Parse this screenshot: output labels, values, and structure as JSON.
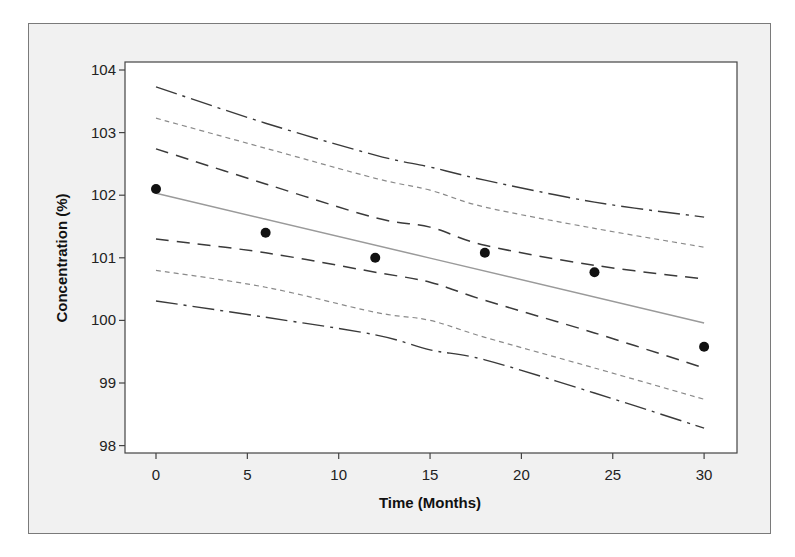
{
  "chart_data": {
    "type": "scatter",
    "title": "",
    "xlabel": "Time (Months)",
    "ylabel": "Concentration (%)",
    "xlim": [
      -1.7,
      31.8
    ],
    "ylim": [
      97.9,
      104.1
    ],
    "x_ticks": [
      0,
      5,
      10,
      15,
      20,
      25,
      30
    ],
    "y_ticks": [
      98,
      99,
      100,
      101,
      102,
      103,
      104
    ],
    "grid": false,
    "legend": null,
    "points": {
      "name": "Observed",
      "x": [
        0,
        6,
        12,
        18,
        24,
        30
      ],
      "y": [
        102.1,
        101.4,
        101.0,
        101.08,
        100.77,
        99.58
      ]
    },
    "series": [
      {
        "name": "Upper outer band",
        "style": "dash-dot",
        "x": [
          0,
          6,
          12,
          15,
          18,
          24,
          30
        ],
        "y": [
          103.73,
          103.15,
          102.64,
          102.45,
          102.24,
          101.89,
          101.65
        ]
      },
      {
        "name": "Upper middle band",
        "style": "short-dash",
        "x": [
          0,
          6,
          12,
          15,
          18,
          24,
          30
        ],
        "y": [
          103.23,
          102.75,
          102.27,
          102.08,
          101.81,
          101.47,
          101.17
        ]
      },
      {
        "name": "Upper inner band",
        "style": "dashed",
        "x": [
          0,
          6,
          12,
          15,
          18,
          24,
          30
        ],
        "y": [
          102.74,
          102.18,
          101.64,
          101.49,
          101.2,
          100.88,
          100.66
        ]
      },
      {
        "name": "Regression line",
        "style": "solid",
        "x": [
          0,
          30
        ],
        "y": [
          102.03,
          99.96
        ]
      },
      {
        "name": "Lower inner band",
        "style": "dashed",
        "x": [
          0,
          6,
          12,
          15,
          18,
          24,
          30
        ],
        "y": [
          101.3,
          101.08,
          100.77,
          100.61,
          100.32,
          99.8,
          99.24
        ]
      },
      {
        "name": "Lower middle band",
        "style": "short-dash",
        "x": [
          0,
          6,
          12,
          15,
          18,
          24,
          30
        ],
        "y": [
          100.8,
          100.53,
          100.13,
          100.0,
          99.73,
          99.24,
          98.74
        ]
      },
      {
        "name": "Lower outer band",
        "style": "dash-dot",
        "x": [
          0,
          6,
          12,
          15,
          18,
          24,
          30
        ],
        "y": [
          100.31,
          100.05,
          99.77,
          99.53,
          99.37,
          98.84,
          98.28
        ]
      }
    ]
  },
  "styles": {
    "dash-dot": {
      "stroke": "#3a3a3a",
      "width": 1.4,
      "dasharray": "22 6 3 6"
    },
    "short-dash": {
      "stroke": "#8a8a8a",
      "width": 1.2,
      "dasharray": "5 4"
    },
    "dashed": {
      "stroke": "#3a3a3a",
      "width": 1.5,
      "dasharray": "13 8"
    },
    "solid": {
      "stroke": "#9a9a9a",
      "width": 1.5,
      "dasharray": "none"
    }
  }
}
